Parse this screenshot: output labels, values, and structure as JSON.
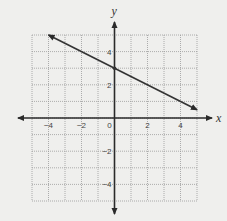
{
  "chart_data": {
    "type": "line",
    "title": "",
    "xlabel": "x",
    "ylabel": "y",
    "xlim": [
      -5,
      5
    ],
    "ylim": [
      -5,
      5
    ],
    "grid": true,
    "x_ticks": [
      -4,
      -2,
      0,
      2,
      4
    ],
    "y_ticks": [
      4,
      2,
      -2,
      -4
    ],
    "x_tick_labels": [
      "−4",
      "−2",
      "0",
      "2",
      "4"
    ],
    "y_tick_labels": [
      "4",
      "2",
      "−2",
      "−4"
    ],
    "series": [
      {
        "name": "line",
        "equation": "y = -0.5x + 3",
        "x": [
          -4,
          5
        ],
        "y": [
          5,
          0.5
        ],
        "arrows_both_ends": true,
        "point": [
          0,
          3
        ]
      }
    ],
    "colors": {
      "background": "#efefed",
      "grid": "#9a9a9a",
      "axes": "#2a2a2a",
      "line": "#333333"
    }
  }
}
